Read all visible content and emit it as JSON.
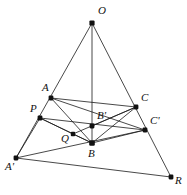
{
  "figure": {
    "type": "line-diagram",
    "width": 187,
    "height": 195,
    "background_color": "#ffffff",
    "line_color": "#1a1a1a",
    "point_color": "#111111"
  },
  "points": [
    {
      "id": "O",
      "label": "O",
      "x": 92,
      "y": 23,
      "label_x": 98,
      "label_y": 5,
      "dot_size": 2.6
    },
    {
      "id": "A",
      "label": "A",
      "x": 51,
      "y": 98,
      "label_x": 42,
      "label_y": 82,
      "dot_size": 2.4
    },
    {
      "id": "C",
      "label": "C",
      "x": 136,
      "y": 107,
      "label_x": 141,
      "label_y": 92,
      "dot_size": 2.4
    },
    {
      "id": "P",
      "label": "P",
      "x": 40,
      "y": 118,
      "label_x": 30,
      "label_y": 103,
      "dot_size": 2.4
    },
    {
      "id": "Bp",
      "label": "B'",
      "x": 92,
      "y": 126,
      "label_x": 97,
      "label_y": 110,
      "dot_size": 2.4
    },
    {
      "id": "Cp",
      "label": "C'",
      "x": 145,
      "y": 130,
      "label_x": 150,
      "label_y": 115,
      "dot_size": 2.4
    },
    {
      "id": "Q",
      "label": "Q",
      "x": 73,
      "y": 134,
      "label_x": 61,
      "label_y": 133,
      "dot_size": 2.2
    },
    {
      "id": "B",
      "label": "B",
      "x": 92,
      "y": 143,
      "label_x": 88,
      "label_y": 148,
      "dot_size": 2.8
    },
    {
      "id": "Ap",
      "label": "A'",
      "x": 16,
      "y": 158,
      "label_x": 5,
      "label_y": 161,
      "dot_size": 2.4
    },
    {
      "id": "R",
      "label": "R",
      "x": 171,
      "y": 177,
      "label_x": 175,
      "label_y": 175,
      "dot_size": 2.4
    }
  ],
  "segments": [
    {
      "name": "O-A'",
      "from": "O",
      "to": "Ap"
    },
    {
      "name": "O-B",
      "from": "O",
      "to": "B"
    },
    {
      "name": "O-R",
      "from": "O",
      "to": "R"
    },
    {
      "name": "A-C",
      "from": "A",
      "to": "C"
    },
    {
      "name": "A-B",
      "from": "A",
      "to": "B"
    },
    {
      "name": "A-C'",
      "from": "A",
      "to": "Cp"
    },
    {
      "name": "P-C'",
      "from": "P",
      "to": "Cp"
    },
    {
      "name": "P-B",
      "from": "P",
      "to": "B"
    },
    {
      "name": "P-A'",
      "from": "P",
      "to": "Ap"
    },
    {
      "name": "A'-C'",
      "from": "Ap",
      "to": "Cp"
    },
    {
      "name": "A'-R",
      "from": "Ap",
      "to": "R"
    },
    {
      "name": "B-C",
      "from": "B",
      "to": "C"
    },
    {
      "name": "B-C'",
      "from": "B",
      "to": "Cp"
    },
    {
      "name": "B'-C",
      "from": "Bp",
      "to": "C"
    },
    {
      "name": "Q-C",
      "from": "Q",
      "to": "C"
    },
    {
      "name": "Q-B",
      "from": "Q",
      "to": "B"
    },
    {
      "name": "Q-P",
      "from": "Q",
      "to": "P"
    }
  ]
}
